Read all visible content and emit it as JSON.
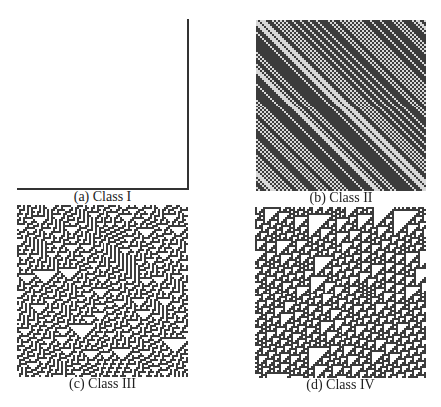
{
  "figure": {
    "panels": [
      {
        "id": "a",
        "caption": "(a) Class I",
        "rule": "uniform",
        "left": 17,
        "top": 19,
        "width": 171,
        "height": 171
      },
      {
        "id": "b",
        "caption": "(b) Class II",
        "rule": "periodic-diagonal",
        "left": 256,
        "top": 20,
        "width": 170,
        "height": 171
      },
      {
        "id": "c",
        "caption": "(c) Class III",
        "rule": 30,
        "left": 17,
        "top": 205,
        "width": 171,
        "height": 172
      },
      {
        "id": "d",
        "caption": "(d) Class IV",
        "rule": 110,
        "left": 255,
        "top": 207,
        "width": 171,
        "height": 171
      }
    ],
    "colors": {
      "dark": "#3c3c3c",
      "light": "#ffffff",
      "frame": "#222222"
    }
  }
}
